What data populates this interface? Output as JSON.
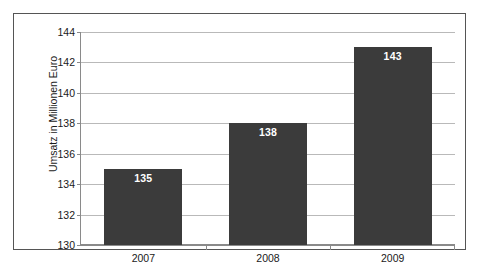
{
  "chart_data": {
    "type": "bar",
    "title": "",
    "subtitle": "",
    "xlabel": "",
    "ylabel": "Umsatz in Millionen Euro",
    "categories": [
      "2007",
      "2008",
      "2009"
    ],
    "values": [
      135,
      138,
      143
    ],
    "data_labels": [
      "135",
      "138",
      "143"
    ],
    "ylim": [
      130,
      144
    ],
    "yticks": [
      130,
      132,
      134,
      136,
      138,
      140,
      142,
      144
    ],
    "ytick_labels": [
      "130",
      "132",
      "134",
      "136",
      "138",
      "140",
      "142",
      "144"
    ],
    "grid": true,
    "grid_axis": "y",
    "legend": false,
    "legend_position": "none",
    "series": [
      {
        "name": "Umsatz",
        "values": [
          135,
          138,
          143
        ],
        "color": "#3b3b3b"
      }
    ],
    "colors": {
      "bar": "#3b3b3b",
      "gridline": "#b9b9b9",
      "axis": "#8a8a8a",
      "frame": "#555555",
      "background": "#ffffff",
      "text": "#1a1a1a",
      "data_label_text": "#ffffff"
    }
  }
}
